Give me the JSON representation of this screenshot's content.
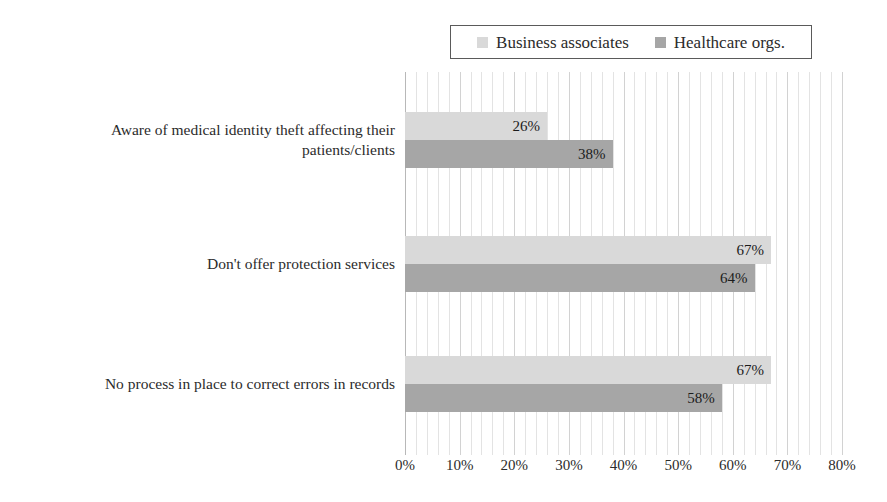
{
  "legend": {
    "entries": [
      {
        "label": "Business associates",
        "color": "#d9d9d9",
        "swatch_name": "legend-swatch-business-associates"
      },
      {
        "label": "Healthcare orgs.",
        "color": "#a6a6a6",
        "swatch_name": "legend-swatch-healthcare-orgs"
      }
    ]
  },
  "axis": {
    "ticks": [
      "0%",
      "10%",
      "20%",
      "30%",
      "40%",
      "50%",
      "60%",
      "70%",
      "80%"
    ]
  },
  "chart_data": {
    "type": "bar",
    "orientation": "horizontal",
    "title": "",
    "xlabel": "",
    "ylabel": "",
    "xlim": [
      0,
      80
    ],
    "xtick_step": 10,
    "minor_gridline_step": 2,
    "grid": true,
    "legend_position": "top",
    "value_suffix": "%",
    "categories": [
      "Aware of medical identity theft affecting their patients/clients",
      "Don't offer protection services",
      "No process in place to correct errors in records"
    ],
    "category_lines": [
      [
        "Aware of medical identity theft affecting their",
        "patients/clients"
      ],
      [
        "Don't offer protection services"
      ],
      [
        "No process in place to correct errors in records"
      ]
    ],
    "series": [
      {
        "name": "Business associates",
        "color": "#d9d9d9",
        "values": [
          26,
          67,
          67
        ],
        "labels": [
          "26%",
          "67%",
          "67%"
        ]
      },
      {
        "name": "Healthcare orgs.",
        "color": "#a6a6a6",
        "values": [
          38,
          64,
          58
        ],
        "labels": [
          "38%",
          "64%",
          "58%"
        ]
      }
    ]
  }
}
